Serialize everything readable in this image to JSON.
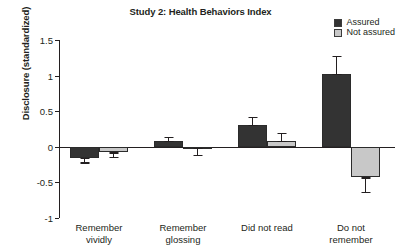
{
  "chart_data": {
    "type": "bar",
    "title": "Study 2: Health Behaviors Index",
    "xlabel": "",
    "ylabel": "Disclosure (standardized)",
    "categories": [
      "Remember vividly",
      "Remember glossing",
      "Did not read",
      "Do not remember"
    ],
    "category_lines": [
      [
        "Remember",
        "vividly"
      ],
      [
        "Remember",
        "glossing"
      ],
      [
        "Did not read",
        ""
      ],
      [
        "Do not",
        "remember"
      ]
    ],
    "ylim": [
      -1,
      1.5
    ],
    "yticks": [
      1.5,
      1,
      0.5,
      0,
      -0.5,
      -1
    ],
    "ytick_labels": [
      "1.5",
      "1",
      "0.5",
      "0",
      "-0.5",
      "-1"
    ],
    "grid": false,
    "legend_position": "top-right",
    "series": [
      {
        "name": "Assured",
        "color": "#333333",
        "values": [
          -0.16,
          0.08,
          0.31,
          1.02
        ],
        "errors": [
          0.06,
          0.06,
          0.11,
          0.26
        ]
      },
      {
        "name": "Not assured",
        "color": "#c8c8c8",
        "values": [
          -0.08,
          -0.01,
          0.08,
          -0.43
        ],
        "errors": [
          0.06,
          0.1,
          0.11,
          0.2
        ]
      }
    ]
  },
  "legend": {
    "items": [
      {
        "label": "Assured",
        "color": "#333333"
      },
      {
        "label": "Not assured",
        "color": "#c8c8c8"
      }
    ]
  },
  "axis": {
    "y_title": "Disclosure (standardized)"
  }
}
